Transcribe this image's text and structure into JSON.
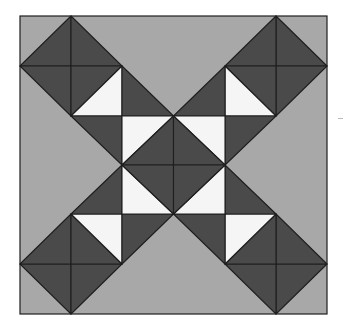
{
  "block": {
    "name": "quilt-block",
    "bounds": {
      "x": 20,
      "y": 16,
      "w": 307,
      "h": 298
    },
    "center": {
      "x": 173.5,
      "y": 165
    },
    "colors": {
      "background": "#a8a8a8",
      "dark": "#4a4a4a",
      "white": "#f5f5f5",
      "stroke": "#1e1e1e"
    },
    "quadrant_pieces": [
      {
        "fill": "dark",
        "points": "71,16 71,66 20,66"
      },
      {
        "fill": "dark",
        "points": "71,16 122,66 71,66"
      },
      {
        "fill": "dark",
        "points": "20,66 71,66 71,116"
      },
      {
        "fill": "dark",
        "points": "71,66 122,66 71,116"
      },
      {
        "fill": "white",
        "points": "122,66 122,116 71,116"
      },
      {
        "fill": "dark",
        "points": "122,66 122,116 173.5,116"
      },
      {
        "fill": "dark",
        "points": "71,116 122,116 122,165"
      },
      {
        "fill": "white",
        "points": "122,116 173.5,116 122,165"
      },
      {
        "fill": "dark",
        "points": "173.5,116 173.5,165 122,165"
      }
    ]
  }
}
